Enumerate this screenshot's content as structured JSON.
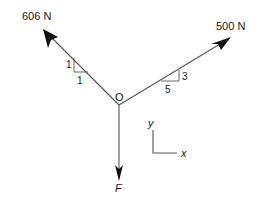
{
  "diagram": {
    "type": "free-body force diagram",
    "origin": {
      "label": "O"
    },
    "forces": [
      {
        "id": "force-606",
        "label": "606 N",
        "direction": "upper-left",
        "slope": {
          "rise": "1",
          "run": "1"
        }
      },
      {
        "id": "force-500",
        "label": "500 N",
        "direction": "upper-right",
        "slope": {
          "rise": "3",
          "run": "5"
        }
      },
      {
        "id": "force-F",
        "label": "F",
        "direction": "down"
      }
    ],
    "axes": {
      "x_label": "x",
      "y_label": "y"
    },
    "colors": {
      "line": "#555555",
      "arrowhead": "#111111",
      "text": "#1a1a1a",
      "background": "#ffffff"
    }
  }
}
